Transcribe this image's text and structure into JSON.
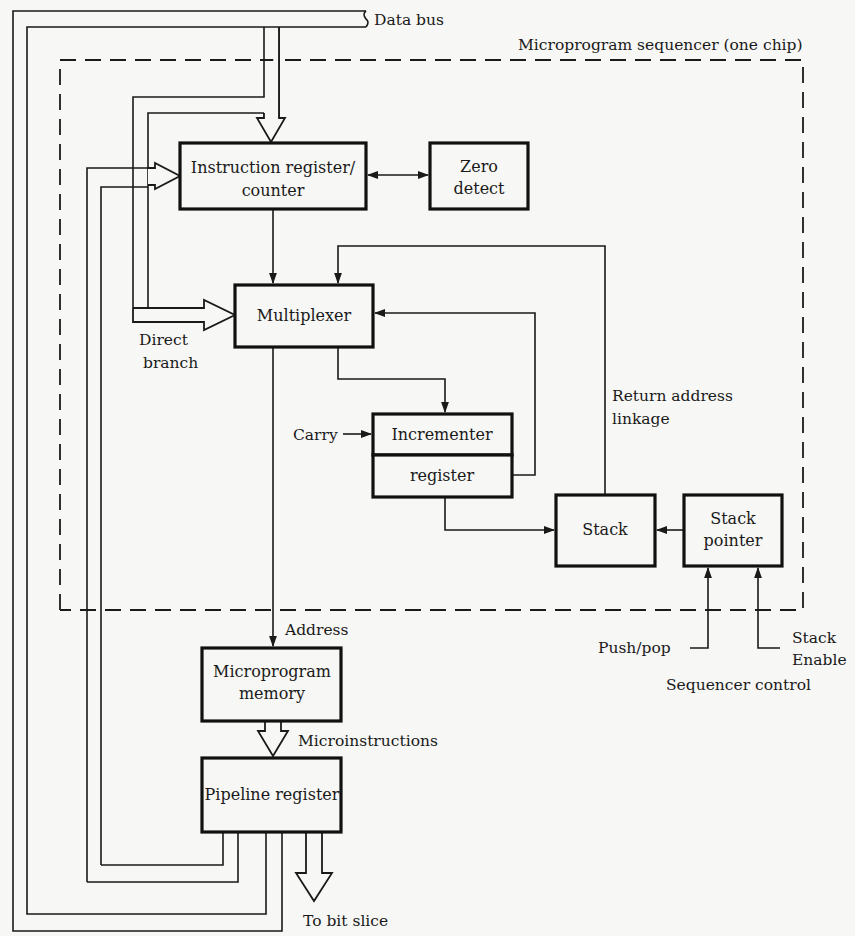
{
  "diagram": {
    "title": "Microprogram sequencer (one chip)",
    "blocks": {
      "instruction_register": {
        "line1": "Instruction register/",
        "line2": "counter"
      },
      "zero_detect": {
        "line1": "Zero",
        "line2": "detect"
      },
      "multiplexer": {
        "label": "Multiplexer"
      },
      "incrementer": {
        "label": "Incrementer"
      },
      "incrementer_register": {
        "label": "register"
      },
      "stack": {
        "label": "Stack"
      },
      "stack_pointer": {
        "line1": "Stack",
        "line2": "pointer"
      },
      "microprogram_memory": {
        "line1": "Microprogram",
        "line2": "memory"
      },
      "pipeline_register": {
        "label": "Pipeline register"
      }
    },
    "labels": {
      "data_bus": "Data bus",
      "direct_branch_1": "Direct",
      "direct_branch_2": "branch",
      "carry": "Carry",
      "return_address_1": "Return address",
      "return_address_2": "linkage",
      "address": "Address",
      "microinstructions": "Microinstructions",
      "to_bit_slice": "To bit slice",
      "push_pop": "Push/pop",
      "stack_enable_1": "Stack",
      "stack_enable_2": "Enable",
      "sequencer_control": "Sequencer control"
    },
    "colors": {
      "ink": "#1a1a1a",
      "paper": "#f7f7f5"
    }
  }
}
